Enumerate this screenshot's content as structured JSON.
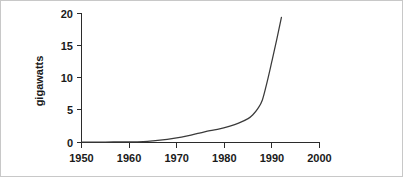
{
  "chart_data": {
    "type": "line",
    "title": "",
    "subtitle": "",
    "xlabel": "",
    "ylabel": "gigawatts",
    "xlim": [
      1950,
      2000
    ],
    "ylim": [
      0,
      20
    ],
    "grid": false,
    "legend": null,
    "legend_position": "none",
    "annotations": [],
    "xticks": [
      "1950",
      "1960",
      "1970",
      "1980",
      "1990",
      "2000"
    ],
    "xtick_values": [
      1950,
      1960,
      1970,
      1980,
      1990,
      2000
    ],
    "yticks": [
      "0",
      "5",
      "10",
      "15",
      "20"
    ],
    "ytick_values": [
      0,
      5,
      10,
      15,
      20
    ],
    "series": [
      {
        "name": "installed capacity",
        "color": "#3a3a3a",
        "x": [
          1950,
          1955,
          1960,
          1963,
          1965,
          1967,
          1969,
          1971,
          1973,
          1975,
          1977,
          1979,
          1981,
          1983,
          1985,
          1986,
          1987,
          1988,
          1989,
          1990,
          1991,
          1992
        ],
        "values": [
          0.05,
          0.07,
          0.1,
          0.15,
          0.25,
          0.4,
          0.6,
          0.85,
          1.15,
          1.5,
          1.85,
          2.1,
          2.5,
          3.0,
          3.7,
          4.3,
          5.2,
          6.6,
          9.4,
          12.6,
          15.9,
          19.4
        ]
      }
    ]
  },
  "axes": {
    "y_axis_title": "gigawatts",
    "x_axis_title": ""
  },
  "colors": {
    "curve": "#3a3a3a",
    "axis": "#2b2b2b",
    "text": "#1a1a1a",
    "border": "#c8c8c8",
    "background": "#ffffff"
  }
}
